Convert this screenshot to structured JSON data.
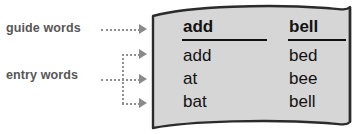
{
  "diagram": {
    "annotations": [
      {
        "id": "guide",
        "label": "guide words"
      },
      {
        "id": "entry",
        "label": "entry words"
      }
    ],
    "page": {
      "background_color": "#d6d6d6",
      "border_color": "#2b2b2b",
      "guide_words": {
        "left": "add",
        "right": "bell"
      },
      "entries": [
        {
          "left": "add",
          "right": "bed"
        },
        {
          "left": "at",
          "right": "bee"
        },
        {
          "left": "bat",
          "right": "bell"
        }
      ]
    },
    "connector": {
      "icon": "arrowhead-right-icon",
      "color": "#8a8a8a",
      "line_style": "dotted"
    },
    "label_color": "#575757"
  }
}
